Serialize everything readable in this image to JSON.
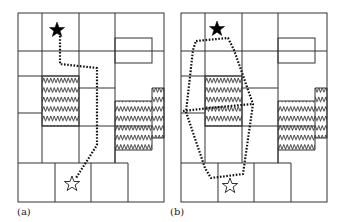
{
  "figure": {
    "panels": [
      {
        "id": "a",
        "label": "(a)",
        "description": "Grid of cells with hatched obstacle regions and a single dotted path from a filled star (start) to an outlined star (goal)",
        "start_marker": "filled-star",
        "goal_marker": "outlined-star",
        "path_style": "dotted"
      },
      {
        "id": "b",
        "label": "(b)",
        "description": "Same grid with a dotted hexagonal region enclosing the start and goal, split by a dotted horizontal line",
        "start_marker": "filled-star",
        "goal_marker": "outlined-star",
        "path_style": "dotted"
      }
    ],
    "icons": {
      "start": "filled-star-icon",
      "goal": "outlined-star-icon",
      "obstacle": "zigzag-hatch"
    },
    "colors": {
      "lines": "#333333",
      "path": "#111111",
      "background": "#ffffff"
    }
  }
}
